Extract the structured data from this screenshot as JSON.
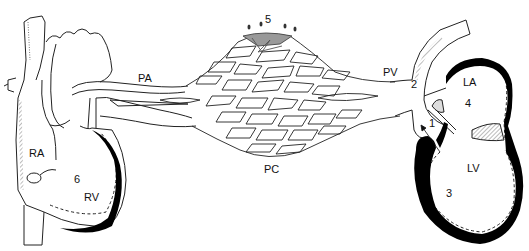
{
  "diagram": {
    "type": "circulation-schematic",
    "labels": {
      "ra": "RA",
      "rv": "RV",
      "pa": "PA",
      "pc": "PC",
      "pv": "PV",
      "la": "LA",
      "lv": "LV",
      "n1": "1",
      "n2": "2",
      "n3": "3",
      "n4": "4",
      "n5": "5",
      "n6": "6"
    },
    "colors": {
      "line": "#222222",
      "wall": "#000000",
      "hatch": "#555555",
      "background": "#ffffff"
    }
  }
}
